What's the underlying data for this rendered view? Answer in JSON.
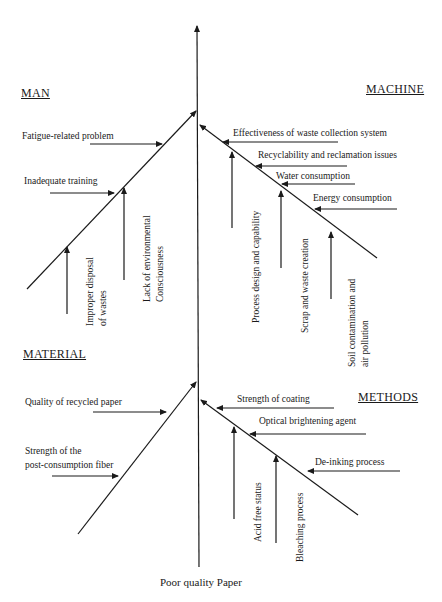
{
  "effect": "Poor quality Paper",
  "categories": {
    "man": {
      "title": "MAN",
      "horizontal_causes": [
        "Fatigue-related problem",
        "Inadequate training"
      ],
      "vertical_causes": [
        [
          "Improper disposal",
          "of wastes"
        ],
        [
          "Lack of environmental",
          "Consciousness"
        ]
      ]
    },
    "machine": {
      "title": "MACHINE",
      "horizontal_causes": [
        "Effectiveness of waste collection system",
        "Recyclability and reclamation issues",
        "Water consumption",
        "Energy consumption"
      ],
      "vertical_causes": [
        [
          "Process design and capability"
        ],
        [
          "Scrap and waste creation"
        ],
        [
          "Soil contamination and",
          "air pollution"
        ]
      ]
    },
    "material": {
      "title": "MATERIAL",
      "horizontal_causes": [
        "Quality of recycled paper",
        [
          "Strength of the",
          "post-consumption fiber"
        ]
      ]
    },
    "methods": {
      "title": "METHODS",
      "horizontal_causes": [
        "Strength of coating",
        "Optical brightening agent",
        "De-inking process"
      ],
      "vertical_causes": [
        [
          "Acid free status"
        ],
        [
          "Bleaching process"
        ]
      ]
    }
  },
  "colors": {
    "ink": "#1a1a1a",
    "background": "#ffffff"
  }
}
